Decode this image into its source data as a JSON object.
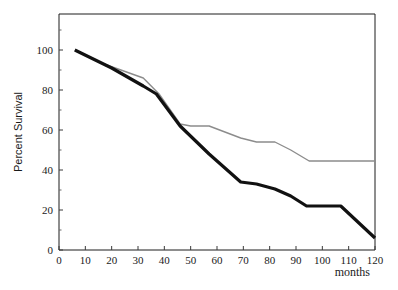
{
  "chart_data": {
    "type": "line",
    "title": "",
    "subtitle": "",
    "xlabel": "months",
    "ylabel": "Percent Survival",
    "xlim": [
      0,
      120
    ],
    "ylim": [
      0,
      118
    ],
    "grid": false,
    "legend": "none",
    "x_ticks": [
      0,
      10,
      20,
      30,
      40,
      50,
      60,
      70,
      80,
      90,
      100,
      110,
      120
    ],
    "x_tick_labels": [
      "0",
      "10",
      "20",
      "30",
      "40",
      "50",
      "60",
      "70",
      "80",
      "90",
      "100",
      "110",
      "120"
    ],
    "y_ticks": [
      0,
      20,
      40,
      60,
      80,
      100
    ],
    "y_tick_labels": [
      "0",
      "20",
      "40",
      "60",
      "80",
      "100"
    ],
    "y_minor_ticks": [
      10,
      30,
      50,
      70,
      90,
      110
    ],
    "series": [
      {
        "name": "upper-curve",
        "color": "#8c8c8c",
        "line_width": 1.4,
        "x": [
          6,
          15,
          32,
          38,
          46,
          50,
          57,
          69,
          75,
          82,
          88,
          95,
          107,
          120
        ],
        "y": [
          100,
          94,
          86,
          78,
          63,
          62,
          62,
          56,
          54,
          54,
          50,
          44.5,
          44.5,
          44.5
        ]
      },
      {
        "name": "lower-curve",
        "color": "#111111",
        "line_width": 3.2,
        "x": [
          6,
          20,
          32,
          37,
          46,
          57,
          69,
          75,
          82,
          88,
          94,
          107,
          120
        ],
        "y": [
          100,
          91,
          82,
          78,
          62,
          48,
          34,
          33,
          30.5,
          27,
          22,
          22,
          6
        ]
      }
    ],
    "annotations": []
  },
  "axis": {
    "x_title": "months",
    "y_title": "Percent Survival"
  }
}
